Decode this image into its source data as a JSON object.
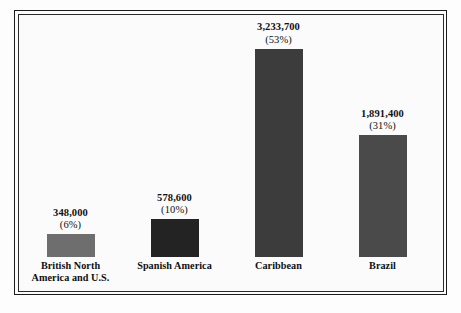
{
  "figure": {
    "background_color": "#fdfdfd",
    "frame_color": "#1b1b1b",
    "plot_background": "#fbfbfb"
  },
  "chart_data": {
    "type": "bar",
    "title": "",
    "subtitle": "",
    "xlabel": "",
    "ylabel": "",
    "grid": false,
    "legend": "none",
    "axis_visible": false,
    "ylim": [
      0,
      3233700
    ],
    "categories": [
      "British North America and U.S.",
      "Spanish America",
      "Caribbean",
      "Brazil"
    ],
    "values": [
      348000,
      578600,
      3233700,
      1891400
    ],
    "value_labels": [
      "348,000",
      "578,600",
      "3,233,700",
      "1,891,400"
    ],
    "percent_labels": [
      "(6%)",
      "(10%)",
      "(53%)",
      "(31%)"
    ],
    "percents": [
      6,
      10,
      53,
      31
    ],
    "bar_colors": [
      "#6e6e6e",
      "#232323",
      "#3c3c3c",
      "#4a4a4a"
    ]
  },
  "bars": [
    {
      "name": "british-north-america",
      "caption_line1": "British North",
      "caption_line2": "America and U.S.",
      "value_label": "348,000",
      "percent_label": "(6%)",
      "color": "#6e6e6e"
    },
    {
      "name": "spanish-america",
      "caption_line1": "Spanish America",
      "caption_line2": "",
      "value_label": "578,600",
      "percent_label": "(10%)",
      "color": "#232323"
    },
    {
      "name": "caribbean",
      "caption_line1": "Caribbean",
      "caption_line2": "",
      "value_label": "3,233,700",
      "percent_label": "(53%)",
      "color": "#3c3c3c"
    },
    {
      "name": "brazil",
      "caption_line1": "Brazil",
      "caption_line2": "",
      "value_label": "1,891,400",
      "percent_label": "(31%)",
      "color": "#4a4a4a"
    }
  ]
}
